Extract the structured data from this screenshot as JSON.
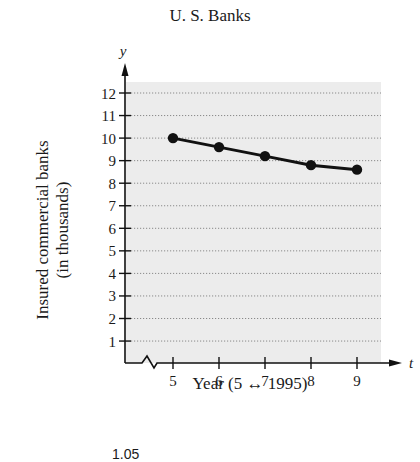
{
  "chart_data": {
    "type": "line",
    "title": "U. S. Banks",
    "xlabel": "Year (5 ↔ 1995)",
    "ylabel": "Insured commercial banks (in thousands)",
    "ylabel_lines": [
      "Insured commercial banks",
      "(in thousands)"
    ],
    "x_axis_symbol": "t",
    "y_axis_symbol": "y",
    "x": [
      5,
      6,
      7,
      8,
      9
    ],
    "values": [
      10.0,
      9.6,
      9.2,
      8.8,
      8.6
    ],
    "x_ticks": [
      5,
      6,
      7,
      8,
      9
    ],
    "y_ticks": [
      1,
      2,
      3,
      4,
      5,
      6,
      7,
      8,
      9,
      10,
      11,
      12
    ],
    "xlim": [
      4,
      9.5
    ],
    "ylim": [
      0,
      12.5
    ],
    "grid": "horizontal-dotted",
    "axis_break": "x-axis",
    "legend": null,
    "colors": {
      "line": "#111111",
      "marker": "#111111",
      "plot_bg": "#ececec",
      "grid": "#8a8a8a"
    }
  },
  "footer_fragment": "1.05"
}
